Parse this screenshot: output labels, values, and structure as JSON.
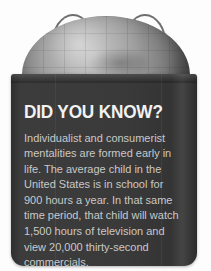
{
  "graphic": {
    "kind": "did-you-know-infographic",
    "illustration": {
      "globe_label": "globe-icon",
      "bag_label": "shopping-bag",
      "handle_left_label": "bag-handle-left",
      "handle_right_label": "bag-handle-right"
    },
    "headline": "DID YOU KNOW?",
    "body": "Individualist and consumerist mentalities are formed early in life. The average child in the United States is in school for 900 hours a year. In that same time period, that child will watch 1,500 hours of television and view 20,000 thirty-second commercials.",
    "body_lines": [
      "Individualist and consumerist",
      "mentalities are formed early in",
      "life. The average child in the",
      "United States is in school for",
      "900 hours a year. In that same",
      "time period, that child will watch",
      "1,500 hours of television and view",
      "20,000 thirty-second commercials."
    ],
    "figures": {
      "school_hours_per_year": "900 hours a year",
      "television_hours": "1,500 hours of television",
      "commercials_viewed": "20,000 thirty-second commercials"
    },
    "colors": {
      "background": "#fdfdfd",
      "bag": "#3a3a3a",
      "headline_text": "#f2f2f2",
      "body_text": "#c9c9c9",
      "globe_light": "#b4b4b4",
      "globe_dark": "#3e3e3e",
      "handle": "#6e6e6e"
    }
  }
}
